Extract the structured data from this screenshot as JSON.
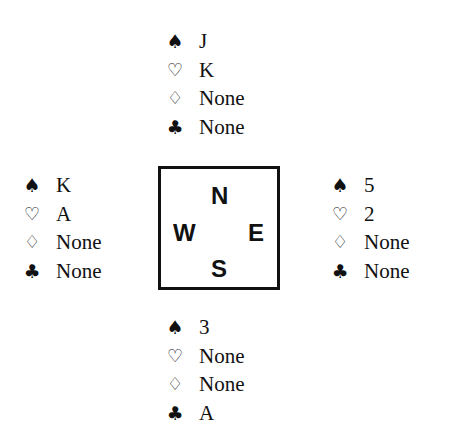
{
  "suits": {
    "spades": "♠",
    "hearts": "♡",
    "diamonds": "♢",
    "clubs": "♣"
  },
  "compass": {
    "north": "N",
    "west": "W",
    "east": "E",
    "south": "S"
  },
  "hands": {
    "north": {
      "spades": "J",
      "hearts": "K",
      "diamonds": "None",
      "clubs": "None"
    },
    "west": {
      "spades": "K",
      "hearts": "A",
      "diamonds": "None",
      "clubs": "None"
    },
    "east": {
      "spades": "5",
      "hearts": "2",
      "diamonds": "None",
      "clubs": "None"
    },
    "south": {
      "spades": "3",
      "hearts": "None",
      "diamonds": "None",
      "clubs": "A"
    }
  },
  "colors": {
    "ink": "#111111",
    "background": "#ffffff"
  }
}
